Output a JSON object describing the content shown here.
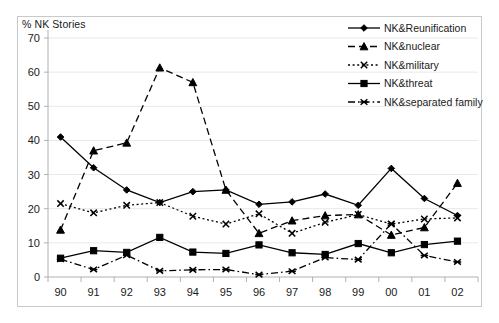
{
  "chart_data": {
    "type": "line",
    "title": "",
    "ylabel": "% NK Stories",
    "xlabel": "",
    "categories": [
      "90",
      "91",
      "92",
      "93",
      "94",
      "95",
      "96",
      "97",
      "98",
      "99",
      "00",
      "01",
      "02"
    ],
    "ylim": [
      0,
      70
    ],
    "yticks": [
      0,
      10,
      20,
      30,
      40,
      50,
      60,
      70
    ],
    "grid": true,
    "legend_position": "top-right",
    "series": [
      {
        "name": "NK&Reunification",
        "marker": "diamond",
        "linestyle": "solid",
        "color": "#000000",
        "values": [
          41,
          32,
          25.5,
          21.8,
          25,
          25.5,
          21.3,
          22,
          24.3,
          21,
          31.8,
          23,
          18
        ]
      },
      {
        "name": "NK&nuclear",
        "marker": "triangle",
        "linestyle": "dashed",
        "color": "#000000",
        "values": [
          13.8,
          37,
          39.3,
          61.3,
          57,
          25.5,
          12.8,
          16.5,
          18,
          18.3,
          12.3,
          14.5,
          27.5
        ]
      },
      {
        "name": "NK&military",
        "marker": "x",
        "linestyle": "dotted",
        "color": "#000000",
        "values": [
          21.5,
          18.8,
          21,
          21.8,
          17.8,
          15.5,
          18.5,
          12.8,
          16,
          18.3,
          15.5,
          17,
          17.3
        ]
      },
      {
        "name": "NK&threat",
        "marker": "square",
        "linestyle": "solid",
        "color": "#000000",
        "values": [
          5.5,
          7.7,
          7.2,
          11.6,
          7.3,
          6.9,
          9.4,
          7.1,
          6.6,
          9.8,
          7.1,
          9.5,
          10.5
        ]
      },
      {
        "name": "NK&separated family",
        "marker": "star",
        "linestyle": "dashdot",
        "color": "#000000",
        "values": [
          5.2,
          2.2,
          6.4,
          1.8,
          2.1,
          2.2,
          0.7,
          1.7,
          5.7,
          5.1,
          15.6,
          6.3,
          4.4
        ]
      }
    ]
  },
  "legend": {
    "items": [
      {
        "label": "NK&Reunification"
      },
      {
        "label": "NK&nuclear"
      },
      {
        "label": "NK&military"
      },
      {
        "label": "NK&threat"
      },
      {
        "label": "NK&separated family"
      }
    ]
  }
}
